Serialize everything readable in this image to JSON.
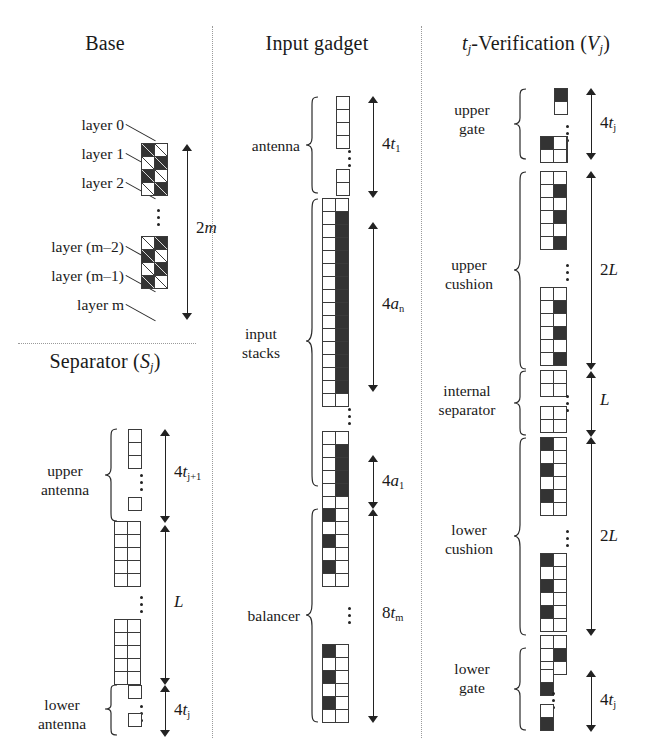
{
  "figure": {
    "panels": [
      {
        "id": "base",
        "title": "Base",
        "labels": {
          "layer0": "layer 0",
          "layer1": "layer 1",
          "layer2": "layer 2",
          "layer_m_minus_2": "layer (m–2)",
          "layer_m_minus_1": "layer (m–1)",
          "layer_m": "layer m",
          "measure_2m": "2m"
        }
      },
      {
        "id": "separator",
        "title": "Separator (Sⱼ)",
        "labels": {
          "upper_antenna": "upper\nantenna",
          "lower_antenna": "lower\nantenna",
          "measure_upper": "4tⱼ₊₁",
          "measure_L": "L",
          "measure_lower": "4tⱼ"
        }
      },
      {
        "id": "input-gadget",
        "title": "Input gadget",
        "labels": {
          "antenna": "antenna",
          "input_stacks": "input\nstacks",
          "balancer": "balancer",
          "measure_4t1": "4t₁",
          "measure_4an": "4aₙ",
          "measure_4a1": "4a₁",
          "measure_8tm": "8tₘ"
        }
      },
      {
        "id": "verification",
        "title": "tⱼ-Verification (Vⱼ)",
        "labels": {
          "upper_gate": "upper\ngate",
          "upper_cushion": "upper\ncushion",
          "internal_separator": "internal\nseparator",
          "lower_cushion": "lower\ncushion",
          "lower_gate": "lower\ngate",
          "measure_upper_gate": "4tⱼ",
          "measure_upper_cushion": "2L",
          "measure_internal": "L",
          "measure_lower_cushion": "2L",
          "measure_lower_gate": "4tⱼ"
        }
      }
    ],
    "title_parts": {
      "base": {
        "text": "Base"
      },
      "separator": {
        "pre": "Separator (",
        "ital": "S",
        "sub": "j",
        "post": ")"
      },
      "input_gadget": {
        "text": "Input gadget"
      },
      "verification": {
        "t": "t",
        "tsub": "j",
        "mid": "-Verification (",
        "v": "V",
        "vsub": "j",
        "post": ")"
      }
    },
    "measures": {
      "two_m": {
        "num": "2",
        "ital": "m"
      },
      "four_t1": {
        "num": "4",
        "ital": "t",
        "sub": "1"
      },
      "four_an": {
        "num": "4",
        "ital": "a",
        "sub": "n"
      },
      "four_a1": {
        "num": "4",
        "ital": "a",
        "sub": "1"
      },
      "eight_tm": {
        "num": "8",
        "ital": "t",
        "sub": "m"
      },
      "four_tj1": {
        "num": "4",
        "ital": "t",
        "sub": "j+1"
      },
      "L": {
        "num": "",
        "ital": "L",
        "sub": ""
      },
      "two_L": {
        "num": "2",
        "ital": "L",
        "sub": ""
      },
      "four_tj": {
        "num": "4",
        "ital": "t",
        "sub": "j"
      }
    },
    "group_labels": {
      "antenna": "antenna",
      "input_stacks_l1": "input",
      "input_stacks_l2": "stacks",
      "balancer": "balancer",
      "upper_antenna_l1": "upper",
      "upper_antenna_l2": "antenna",
      "lower_antenna_l1": "lower",
      "lower_antenna_l2": "antenna",
      "upper_gate_l1": "upper",
      "upper_gate_l2": "gate",
      "upper_cushion_l1": "upper",
      "upper_cushion_l2": "cushion",
      "internal_sep_l1": "internal",
      "internal_sep_l2": "separator",
      "lower_cushion_l1": "lower",
      "lower_cushion_l2": "cushion",
      "lower_gate_l1": "lower",
      "lower_gate_l2": "gate"
    },
    "base_layer_labels": [
      "layer 0",
      "layer 1",
      "layer 2",
      "layer (m–2)",
      "layer (m–1)",
      "layer m"
    ],
    "colors": {
      "ink": "#1a1a1a",
      "cell_border": "#3a3a3a",
      "cell_fill": "#333333",
      "paper": "#ffffff",
      "divider": "#9a9a9a"
    },
    "cell_patterns": {
      "base_upper": [
        [
          "b",
          "w"
        ],
        [
          "w",
          "b"
        ],
        [
          "b",
          "w"
        ],
        [
          "w",
          "b"
        ]
      ],
      "base_lower": [
        [
          "w",
          "b"
        ],
        [
          "b",
          "w"
        ],
        [
          "w",
          "b"
        ],
        [
          "b",
          "w"
        ]
      ],
      "antenna": [
        [
          "w"
        ],
        [
          "w"
        ],
        [
          "w"
        ],
        [
          "w"
        ]
      ],
      "antenna_tail": [
        [
          "w"
        ],
        [
          "w"
        ]
      ],
      "input_top_pad": [
        [
          "w",
          "w"
        ]
      ],
      "input_an_block": [
        [
          "w",
          "b"
        ],
        [
          "w",
          "b"
        ],
        [
          "w",
          "b"
        ],
        [
          "w",
          "b"
        ],
        [
          "w",
          "b"
        ],
        [
          "w",
          "b"
        ],
        [
          "w",
          "b"
        ],
        [
          "w",
          "b"
        ],
        [
          "w",
          "b"
        ],
        [
          "w",
          "b"
        ],
        [
          "w",
          "b"
        ],
        [
          "w",
          "b"
        ],
        [
          "w",
          "b"
        ],
        [
          "w",
          "b"
        ]
      ],
      "input_bot_pad": [
        [
          "w",
          "w"
        ]
      ],
      "input_a1_head": [
        [
          "w",
          "w"
        ]
      ],
      "input_a1_block": [
        [
          "w",
          "b"
        ],
        [
          "w",
          "b"
        ],
        [
          "w",
          "b"
        ],
        [
          "w",
          "b"
        ]
      ],
      "input_a1_tail": [
        [
          "w",
          "w"
        ]
      ],
      "balancer_top": [
        [
          "b",
          "w"
        ],
        [
          "w",
          "w"
        ],
        [
          "b",
          "w"
        ],
        [
          "w",
          "w"
        ],
        [
          "b",
          "w"
        ],
        [
          "w",
          "w"
        ]
      ],
      "balancer_bot": [
        [
          "b",
          "w"
        ],
        [
          "w",
          "w"
        ],
        [
          "b",
          "w"
        ],
        [
          "w",
          "w"
        ],
        [
          "b",
          "w"
        ],
        [
          "w",
          "w"
        ]
      ],
      "sep_antenna": [
        [
          "w"
        ],
        [
          "w"
        ],
        [
          "w"
        ]
      ],
      "sep_antenna_tail": [
        [
          "w"
        ]
      ],
      "sep_body_top": [
        [
          "w",
          "w"
        ],
        [
          "w",
          "w"
        ],
        [
          "w",
          "w"
        ],
        [
          "w",
          "w"
        ],
        [
          "w",
          "w"
        ]
      ],
      "sep_body_bot": [
        [
          "w",
          "w"
        ],
        [
          "w",
          "w"
        ],
        [
          "w",
          "w"
        ],
        [
          "w",
          "w"
        ],
        [
          "w",
          "w"
        ]
      ],
      "sep_low_ant": [
        [
          "w"
        ]
      ],
      "sep_low_ant_tail": [
        [
          "w"
        ]
      ],
      "ver_gate_top": [
        [
          "b"
        ],
        [
          "w"
        ]
      ],
      "ver_gate_tail": [
        [
          "w"
        ],
        [
          "w"
        ]
      ],
      "ver_gate_join": [
        [
          "b",
          "w"
        ],
        [
          "w",
          "w"
        ]
      ],
      "ver_ucush_top": [
        [
          "w",
          "w"
        ],
        [
          "w",
          "b"
        ],
        [
          "w",
          "w"
        ],
        [
          "w",
          "b"
        ],
        [
          "w",
          "w"
        ],
        [
          "w",
          "b"
        ]
      ],
      "ver_ucush_bot": [
        [
          "w",
          "w"
        ],
        [
          "w",
          "b"
        ],
        [
          "w",
          "w"
        ],
        [
          "w",
          "b"
        ],
        [
          "w",
          "w"
        ],
        [
          "w",
          "b"
        ]
      ],
      "ver_isep_top": [
        [
          "w",
          "w"
        ],
        [
          "w",
          "w"
        ]
      ],
      "ver_isep_bot": [
        [
          "w",
          "w"
        ],
        [
          "w",
          "w"
        ]
      ],
      "ver_lcush_top": [
        [
          "b",
          "w"
        ],
        [
          "w",
          "w"
        ],
        [
          "b",
          "w"
        ],
        [
          "w",
          "w"
        ],
        [
          "b",
          "w"
        ],
        [
          "w",
          "w"
        ]
      ],
      "ver_lcush_bot": [
        [
          "b",
          "w"
        ],
        [
          "w",
          "w"
        ],
        [
          "b",
          "w"
        ],
        [
          "w",
          "w"
        ],
        [
          "b",
          "w"
        ],
        [
          "w",
          "w"
        ]
      ],
      "ver_lgate_join": [
        [
          "w",
          "w"
        ],
        [
          "w",
          "b"
        ],
        [
          "w",
          "w"
        ]
      ],
      "ver_lgate_tail": [
        [
          "w"
        ],
        [
          "b"
        ]
      ]
    }
  }
}
